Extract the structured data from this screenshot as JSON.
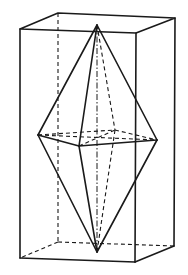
{
  "diagram": {
    "colors": {
      "line": "#1a1a1a",
      "background": "#ffffff"
    },
    "vertices": {
      "box_top_front_left": [
        20,
        29
      ],
      "box_top_front_right": [
        136,
        33
      ],
      "box_top_back_right": [
        175,
        18
      ],
      "box_top_back_left": [
        58,
        13
      ],
      "box_bottom_front_left": [
        20,
        258
      ],
      "box_bottom_front_right": [
        135,
        262
      ],
      "box_bottom_back_right": [
        174,
        246
      ],
      "box_bottom_back_left": [
        58,
        242
      ],
      "apex_top": [
        97,
        25
      ],
      "apex_bottom": [
        97,
        252
      ],
      "mid_left": [
        38,
        135
      ],
      "mid_front": [
        79,
        146
      ],
      "mid_right": [
        157,
        140
      ],
      "mid_back": [
        115,
        130
      ]
    }
  }
}
